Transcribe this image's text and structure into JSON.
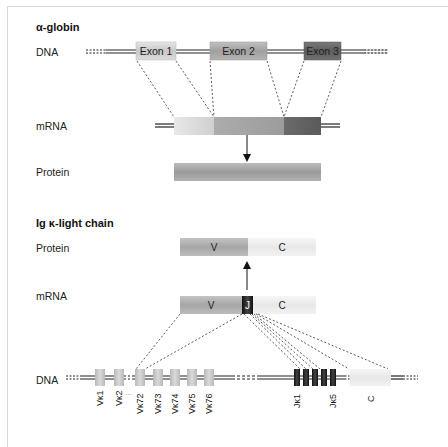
{
  "alpha_globin": {
    "title": "α-globin",
    "dna_label": "DNA",
    "mrna_label": "mRNA",
    "protein_label": "Protein",
    "exons": [
      {
        "label": "Exon 1",
        "color": "#d2d2d2"
      },
      {
        "label": "Exon 2",
        "color": "#a8a8a8"
      },
      {
        "label": "Exon 3",
        "color": "#6e6e6e"
      }
    ],
    "protein_color": "#a4a4a4"
  },
  "ig_kappa": {
    "title": "Ig κ-light chain",
    "protein_label": "Protein",
    "mrna_label": "mRNA",
    "dna_label": "DNA",
    "protein_segments": [
      {
        "label": "V",
        "color": "#b0b0b0"
      },
      {
        "label": "C",
        "color": "#f0f0f0"
      }
    ],
    "mrna_segments": [
      {
        "label": "V",
        "color": "#b0b0b0"
      },
      {
        "label": "J",
        "color": "#1a1a1a"
      },
      {
        "label": "C",
        "color": "#f0f0f0"
      }
    ],
    "v_genes": [
      "Vκ1",
      "Vκ2",
      "Vκ72",
      "Vκ73",
      "Vκ74",
      "Vκ75",
      "Vκ76"
    ],
    "v_gap_marker": "···",
    "j_genes_labels": [
      "Jκ1",
      "Jκ5"
    ],
    "j_gene_count": 5,
    "c_gene_label": "C"
  }
}
